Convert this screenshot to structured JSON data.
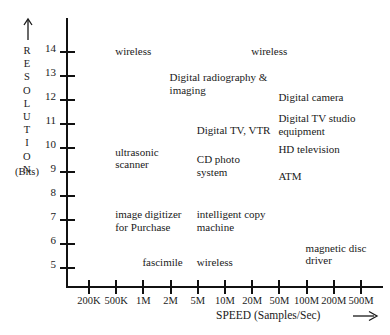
{
  "chart_data": {
    "type": "scatter",
    "title": "",
    "subtitle": "",
    "xlabel": "SPEED (Samples/Sec)",
    "ylabel": "RESOLUTION",
    "ylabel_units": "(Bits)",
    "xlabel_arrow": "⟶",
    "ylabel_arrow": "↑",
    "grid": false,
    "legend": "none",
    "x_scale": "log",
    "x_tick_labels": [
      "200K",
      "500K",
      "1M",
      "2M",
      "5M",
      "10M",
      "20M",
      "50M",
      "100M",
      "200M",
      "500M"
    ],
    "x_tick_values": [
      200000,
      500000,
      1000000,
      2000000,
      5000000,
      10000000,
      20000000,
      50000000,
      100000000,
      200000000,
      500000000
    ],
    "y_tick_labels": [
      "14",
      "13",
      "12",
      "11",
      "10",
      "9",
      "8",
      "7",
      "6",
      "5"
    ],
    "y_tick_values": [
      14,
      13,
      12,
      11,
      10,
      9,
      8,
      7,
      6,
      5
    ],
    "ylim": [
      4,
      15
    ],
    "annotations": [
      {
        "text": "wireless",
        "x": "500K",
        "y": 14.0
      },
      {
        "text": "wireless",
        "x": "20M",
        "y": 14.0
      },
      {
        "text": "Digital radiography &\nimaging",
        "x": "2M",
        "y": 12.9
      },
      {
        "text": "Digital camera",
        "x": "50M",
        "y": 12.1
      },
      {
        "text": "Digital TV studio\nequipment",
        "x": "50M",
        "y": 11.2
      },
      {
        "text": "Digital TV, VTR",
        "x": "5M",
        "y": 10.7
      },
      {
        "text": "HD television",
        "x": "50M",
        "y": 9.9
      },
      {
        "text": "ultrasonic\nscanner",
        "x": "500K",
        "y": 9.8
      },
      {
        "text": "CD photo\nsystem",
        "x": "5M",
        "y": 9.5
      },
      {
        "text": "ATM",
        "x": "50M",
        "y": 8.8
      },
      {
        "text": "image digitizer\nfor Purchase",
        "x": "500K",
        "y": 7.2
      },
      {
        "text": "intelligent copy\nmachine",
        "x": "5M",
        "y": 7.2
      },
      {
        "text": "magnetic disc\ndriver",
        "x": "100M",
        "y": 5.8
      },
      {
        "text": "fascimile",
        "x": "1M",
        "y": 5.2
      },
      {
        "text": "wireless",
        "x": "5M",
        "y": 5.2
      }
    ]
  },
  "axes": {
    "y_letters": [
      "R",
      "E",
      "S",
      "O",
      "L",
      "U",
      "T",
      "I",
      "O",
      "N"
    ]
  },
  "colors": {
    "background": "#ffffff",
    "axis": "#111111",
    "text": "#1a1a1a"
  }
}
